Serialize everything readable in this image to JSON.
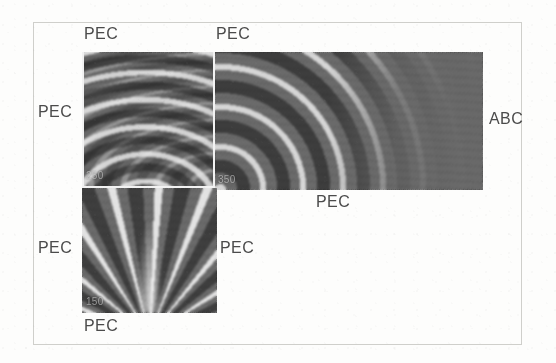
{
  "figure": {
    "caption_absent": true,
    "background_color": "#fdfdfc",
    "frame_color": "#cfcfcb",
    "field_base_color": "#6d6d6d",
    "inset_outline_color": "#f2f2f2",
    "label_color": "#4b4b4b"
  },
  "boundary_labels": {
    "upper_left_top": "PEC",
    "upper_right_top": "PEC",
    "upper_left_side": "PEC",
    "right_side": "ABC",
    "lower_right_of_upper_block": "PEC",
    "lower_left_side": "PEC",
    "lower_block_right": "PEC",
    "lower_block_bottom": "PEC"
  },
  "field_annotations": {
    "upper_left_corner_value": "250",
    "upper_right_corner_value": "350",
    "lower_block_value": "150"
  },
  "regions": [
    {
      "name": "upper-left-field",
      "pattern": "interfering-curved-wavefronts",
      "x": 82,
      "y": 52,
      "width": 133,
      "height": 135
    },
    {
      "name": "upper-right-field",
      "pattern": "concentric-arcs",
      "x": 215,
      "y": 52,
      "width": 268,
      "height": 138
    },
    {
      "name": "lower-field",
      "pattern": "radiating-streaks",
      "x": 82,
      "y": 188,
      "width": 135,
      "height": 125
    }
  ],
  "inset_box": {
    "name": "sub-domain-outline",
    "x": 213,
    "y": 52,
    "width": 2,
    "height": 136
  }
}
